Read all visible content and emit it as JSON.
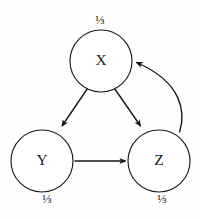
{
  "diagram": {
    "type": "directed-graph",
    "title": "",
    "background_color": "#fefefe",
    "stroke_color": "#141414",
    "node_fill_color": "#ffffff",
    "nodes": [
      {
        "id": "X",
        "label": "X",
        "weight_label": "⅓",
        "weight_value": "1/3",
        "cx": 101,
        "cy": 61,
        "r": 31,
        "weight_x": 100,
        "weight_y": 21,
        "weight_position": "above"
      },
      {
        "id": "Y",
        "label": "Y",
        "weight_label": "⅓",
        "weight_value": "1/3",
        "cx": 42,
        "cy": 161,
        "r": 31,
        "weight_x": 47,
        "weight_y": 200,
        "weight_position": "below"
      },
      {
        "id": "Z",
        "label": "Z",
        "weight_label": "⅓",
        "weight_value": "1/3",
        "cx": 159,
        "cy": 161,
        "r": 31,
        "weight_x": 162,
        "weight_y": 200,
        "weight_position": "below"
      }
    ],
    "edges": [
      {
        "id": "x-to-y",
        "from": "X",
        "to": "Y",
        "shape": "straight",
        "path": "M 87.5 88.5 L 62.0 126.0",
        "label": ""
      },
      {
        "id": "x-to-z",
        "from": "X",
        "to": "Z",
        "shape": "straight",
        "path": "M 114.5 88.5 L 140.5 126.0",
        "label": ""
      },
      {
        "id": "y-to-z",
        "from": "Y",
        "to": "Z",
        "shape": "straight",
        "path": "M 74.5 161.0 L 125.5 161.0",
        "label": ""
      },
      {
        "id": "z-to-x",
        "from": "Z",
        "to": "X",
        "shape": "curved",
        "path": "M 179.5 132.5 C 186.0 112.0 182.0 82.0 136.5 62.5",
        "label": ""
      }
    ]
  }
}
